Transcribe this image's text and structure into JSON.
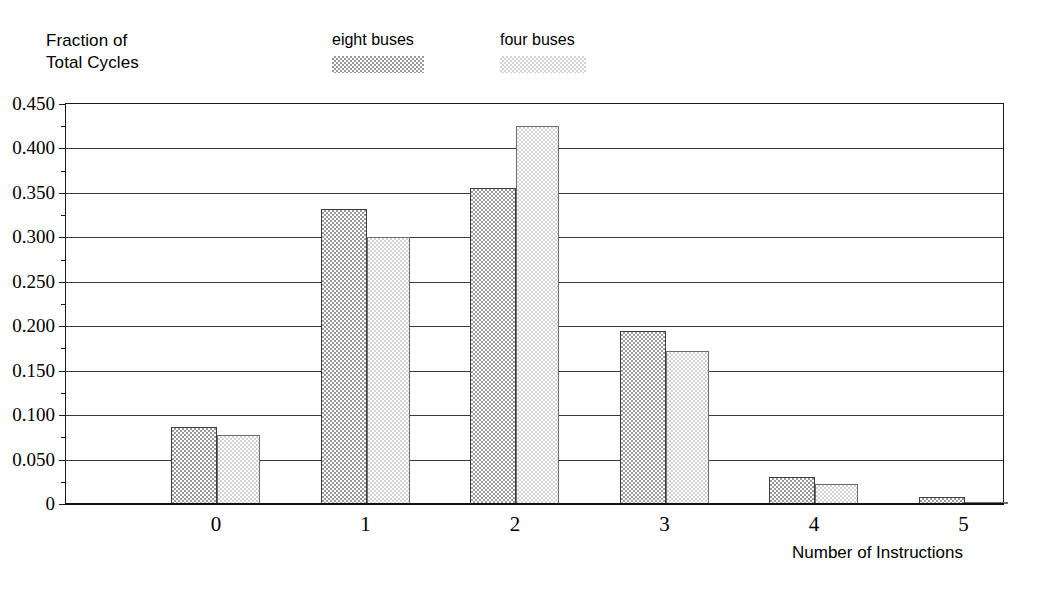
{
  "chart_data": {
    "type": "bar",
    "title": "",
    "xlabel": "Number of Instructions",
    "ylabel": "Fraction of\nTotal Cycles",
    "categories": [
      "0",
      "1",
      "2",
      "3",
      "4",
      "5"
    ],
    "series": [
      {
        "name": "eight buses",
        "color": "#9a9a9a",
        "values": [
          0.087,
          0.332,
          0.355,
          0.195,
          0.03,
          0.008
        ]
      },
      {
        "name": "four buses",
        "color": "#d3d3d3",
        "values": [
          0.078,
          0.3,
          0.425,
          0.172,
          0.022,
          0.001
        ]
      }
    ],
    "ylim": [
      0,
      0.45
    ],
    "ytick_labels": [
      "0.450",
      "0.400",
      "0.350",
      "0.300",
      "0.250",
      "0.200",
      "0.150",
      "0.100",
      "0.050",
      "0"
    ],
    "ytick_values": [
      0.45,
      0.4,
      0.35,
      0.3,
      0.25,
      0.2,
      0.15,
      0.1,
      0.05,
      0
    ],
    "yminor_values": [
      0.425,
      0.375,
      0.325,
      0.275,
      0.225,
      0.175,
      0.125,
      0.075,
      0.025
    ],
    "grid": "horizontal",
    "legend_position": "top-center"
  },
  "legend": {
    "items": [
      {
        "label": "eight buses",
        "swatch": "dark"
      },
      {
        "label": "four buses",
        "swatch": "light"
      }
    ]
  },
  "axis": {
    "y_title": "Fraction of\nTotal Cycles",
    "x_title": "Number of Instructions"
  }
}
